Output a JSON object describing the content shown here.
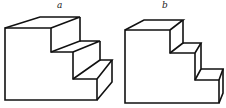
{
  "figures": [
    {
      "id": "a",
      "label": "a",
      "description": "Isometric drawing of a three-step staircase block, steps of equal depth"
    },
    {
      "id": "b",
      "label": "b",
      "description": "Isometric drawing of a three-step staircase block, shallower steps"
    }
  ],
  "colors": {
    "line": "#111111",
    "background": "#ffffff"
  }
}
